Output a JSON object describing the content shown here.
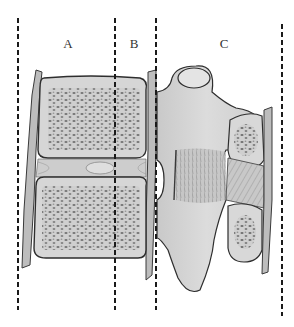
{
  "diagram": {
    "type": "anatomical-illustration",
    "columns": [
      {
        "label": "A",
        "x_center": 68
      },
      {
        "label": "B",
        "x_center": 134
      },
      {
        "label": "C",
        "x_center": 224
      }
    ],
    "divider_lines_x": [
      18,
      115,
      156,
      282
    ],
    "colors": {
      "line": "#1a1a1a",
      "bone_fill": "#d4d4d4",
      "bone_light": "#e6e6e6",
      "cancellous_dots": "#6e6e6e",
      "outline": "#3a3a3a",
      "ligament": "#a8a8a8",
      "background": "#ffffff"
    }
  }
}
